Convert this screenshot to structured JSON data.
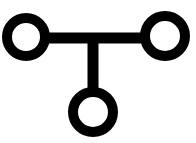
{
  "diagram": {
    "type": "node-link-diagram",
    "shape_description": "T-shaped arrangement of three ring nodes connected by thick straight links",
    "canvas": {
      "width": 196,
      "height": 143
    },
    "colors": {
      "background": "#ffffff",
      "stroke": "#000000"
    },
    "stroke_width": 10,
    "nodes": [
      {
        "id": "node-left",
        "name": "left-node",
        "label": "",
        "cx": 26,
        "cy": 37,
        "outer_radius": 24,
        "radius": 19,
        "stroke_width": 10
      },
      {
        "id": "node-right",
        "name": "right-node",
        "label": "",
        "cx": 165,
        "cy": 36,
        "outer_radius": 25,
        "radius": 20,
        "stroke_width": 10
      },
      {
        "id": "node-bottom",
        "name": "bottom-node",
        "label": "",
        "cx": 93,
        "cy": 112,
        "outer_radius": 25,
        "radius": 20,
        "stroke_width": 10
      }
    ],
    "edges": [
      {
        "id": "edge-left-right",
        "name": "horizontal-connector",
        "from": "node-left",
        "to": "node-right",
        "orientation": "horizontal",
        "x1": 44,
        "y1": 38,
        "x2": 147,
        "y2": 38,
        "stroke_width": 11
      },
      {
        "id": "edge-junction-bottom",
        "name": "vertical-connector",
        "from": "edge-left-right",
        "to": "node-bottom",
        "orientation": "vertical",
        "x1": 93,
        "y1": 34,
        "x2": 93,
        "y2": 92,
        "stroke_width": 11
      }
    ]
  }
}
